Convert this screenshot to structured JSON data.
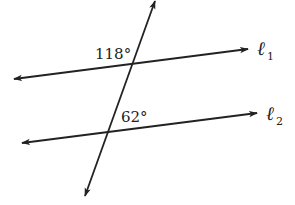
{
  "diagram": {
    "type": "parallel-lines-transversal",
    "angles": [
      {
        "label": "118°",
        "position": "upper-left at l1 intersection"
      },
      {
        "label": "62°",
        "position": "upper-right at l2 intersection"
      }
    ],
    "lines": [
      {
        "name": "l1",
        "symbol": "ℓ",
        "subscript": "1"
      },
      {
        "name": "l2",
        "symbol": "ℓ",
        "subscript": "2"
      }
    ],
    "colors": {
      "stroke": "#222222",
      "background": "#ffffff"
    }
  }
}
